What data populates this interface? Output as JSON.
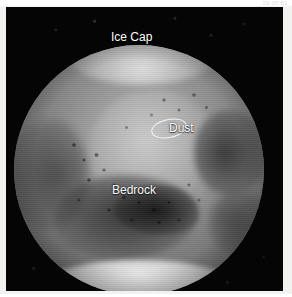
{
  "capture": {
    "timestamp": "19:05:51"
  },
  "image": {
    "subject": "mars-disc-photograph",
    "background_color": "#050505",
    "frame_color": "#f2f2f0",
    "label_color": "#ffffff",
    "annotation_ellipse_color": "#ffffff"
  },
  "annotations": {
    "labels": [
      {
        "id": "ice-cap",
        "text": "Ice Cap"
      },
      {
        "id": "dust",
        "text": "Dust"
      },
      {
        "id": "bedrock",
        "text": "Bedrock"
      }
    ],
    "ellipse": {
      "id": "feature-highlight",
      "label": ""
    }
  }
}
